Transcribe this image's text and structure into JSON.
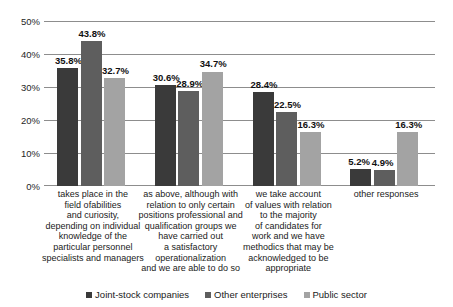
{
  "chart_data": {
    "type": "bar",
    "title": "",
    "subtitle": "",
    "xlabel": "",
    "ylabel": "",
    "ylim": [
      0,
      50
    ],
    "ytick_labels": [
      "0%",
      "10%",
      "20%",
      "30%",
      "40%",
      "50%"
    ],
    "ytick_values": [
      0,
      10,
      20,
      30,
      40,
      50
    ],
    "grid": true,
    "legend_position": "bottom",
    "value_suffix": "%",
    "categories": [
      "takes place in the field ofabilities and curiosity, depending on individual knowledge of the particular personnel specialists and managers",
      "as above, although with relation to only certain positions professional and qualification groups we have carried out a satisfactory operationalization and we are able to do so",
      "we take account of values with relation to the majority of candidates for work and we have methodics that may be acknowledged to be appropriate",
      "other responses"
    ],
    "category_lines": [
      [
        "takes place in the",
        "field ofabilities",
        "and curiosity,",
        "depending on individual",
        "knowledge of the",
        "particular personnel",
        "specialists and managers"
      ],
      [
        "as above, although with",
        "relation to only certain",
        "positions professional and",
        "qualification groups we",
        "have carried out",
        "a satisfactory",
        "operationalization",
        "and we are able to do so"
      ],
      [
        "we take account",
        "of values with relation",
        "to the majority",
        "of candidates for",
        "work and we have",
        "methodics that may be",
        "acknowledged to be",
        "appropriate"
      ],
      [
        "other responses"
      ]
    ],
    "series": [
      {
        "name": "Joint-stock companies",
        "color": "#3a3a3a",
        "values": [
          35.8,
          30.6,
          28.4,
          5.2
        ],
        "labels": [
          "35.8%",
          "30.6%",
          "28.4%",
          "5.2%"
        ]
      },
      {
        "name": "Other enterprises",
        "color": "#5e5e5e",
        "values": [
          43.8,
          28.9,
          22.5,
          4.9
        ],
        "labels": [
          "43.8%",
          "28.9%",
          "22.5%",
          "4.9%"
        ]
      },
      {
        "name": "Public sector",
        "color": "#a3a3a3",
        "values": [
          32.7,
          34.7,
          16.3,
          16.3
        ],
        "labels": [
          "32.7%",
          "34.7%",
          "16.3%",
          "16.3%"
        ]
      }
    ]
  }
}
